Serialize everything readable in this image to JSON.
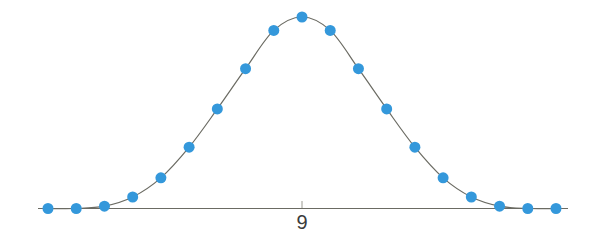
{
  "chart_data": {
    "type": "scatter",
    "title": "",
    "subtitle": "",
    "xlabel": "",
    "ylabel": "",
    "grid": false,
    "legend": null,
    "legend_position": "none",
    "xlim": [
      0,
      18
    ],
    "ylim": [
      0,
      1
    ],
    "x_tick_labels": [
      "9"
    ],
    "x_tick_values": [
      9
    ],
    "y_tick_labels": [],
    "annotations": [],
    "series": [
      {
        "name": "normal-curve-points",
        "marker": "circle",
        "marker_color": "#3498db",
        "marker_size": 11,
        "line_color": "#6b6b63",
        "line_width": 1,
        "x": [
          0,
          1,
          2,
          3,
          4,
          5,
          6,
          7,
          8,
          9,
          10,
          11,
          12,
          13,
          14,
          15,
          16,
          17,
          18
        ],
        "values": [
          0.0,
          0.0,
          0.012,
          0.06,
          0.16,
          0.32,
          0.52,
          0.73,
          0.93,
          1.0,
          0.93,
          0.73,
          0.52,
          0.32,
          0.16,
          0.06,
          0.012,
          0.0,
          0.0
        ]
      }
    ],
    "axis_line": {
      "color": "#6b6b63",
      "y_value": 0,
      "x_start": 0,
      "x_end": 18
    },
    "tick_mark": {
      "x": 9,
      "color": "#9a9a92"
    }
  },
  "icons": {
    "data_point": "circle-marker-icon",
    "axis": "horizontal-axis-icon",
    "tick": "axis-tick-icon"
  }
}
